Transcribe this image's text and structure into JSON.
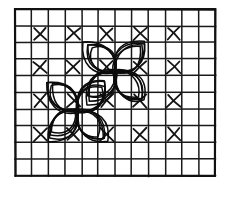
{
  "figure": {
    "background_color": "#ffffff",
    "ink_color": "#111111"
  },
  "grid": {
    "name": "square-grid",
    "origin_x": 15,
    "origin_y": 9,
    "cell_size": 16.7,
    "columns": 12,
    "rows": 10,
    "line_color": "#1a1a1a",
    "line_width": 1.5,
    "border_width": 2.2,
    "border_color": "#111111"
  },
  "x_marks": {
    "name": "x-mark-set",
    "color": "#141414",
    "line_width": 1.8,
    "inset": 2.0,
    "note": "X marks occupy every other cell in a checkerboard arrangement: odd-indexed rows and odd-indexed columns (0-based).",
    "cells": [
      {
        "col": 1,
        "row": 1
      },
      {
        "col": 3,
        "row": 1
      },
      {
        "col": 5,
        "row": 1
      },
      {
        "col": 7,
        "row": 1
      },
      {
        "col": 9,
        "row": 1
      },
      {
        "col": 1,
        "row": 3
      },
      {
        "col": 3,
        "row": 3
      },
      {
        "col": 5,
        "row": 3
      },
      {
        "col": 7,
        "row": 3
      },
      {
        "col": 9,
        "row": 3
      },
      {
        "col": 1,
        "row": 5
      },
      {
        "col": 3,
        "row": 5
      },
      {
        "col": 5,
        "row": 5
      },
      {
        "col": 7,
        "row": 5
      },
      {
        "col": 9,
        "row": 5
      },
      {
        "col": 1,
        "row": 7
      },
      {
        "col": 3,
        "row": 7
      },
      {
        "col": 5,
        "row": 7
      },
      {
        "col": 7,
        "row": 7
      },
      {
        "col": 9,
        "row": 7
      }
    ]
  },
  "rosettes": [
    {
      "name": "rosette-upper-right",
      "center_x": 115,
      "center_y": 72,
      "petal_count": 4,
      "petal_length": 42,
      "petal_width": 17,
      "base_angle_deg": 45,
      "stroke_repeats": 4,
      "stroke_width": 1.5,
      "color": "#0c0c0c",
      "jitter": 2.1
    },
    {
      "name": "rosette-lower-left",
      "center_x": 77,
      "center_y": 111,
      "petal_count": 4,
      "petal_length": 42,
      "petal_width": 17,
      "base_angle_deg": 45,
      "stroke_repeats": 4,
      "stroke_width": 1.5,
      "color": "#0c0c0c",
      "jitter": 2.1
    }
  ],
  "labels": {
    "alt_text": "Monochrome line drawing: graph-paper grid with checkerboard X marks and two spirograph four-petal flowers"
  }
}
